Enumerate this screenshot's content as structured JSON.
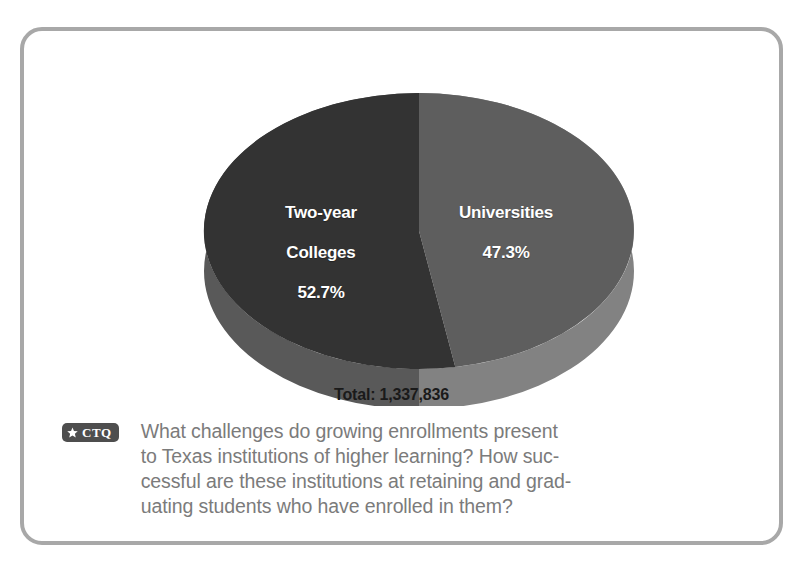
{
  "figure": {
    "frame_border_color": "#a8a8a8",
    "background_color": "#ffffff"
  },
  "chart_data": {
    "type": "pie",
    "title": "",
    "subtitle": "",
    "xlabel": "",
    "ylabel": "",
    "legend_position": "inside-slices",
    "grid": false,
    "total_label": "Total: 1,337,836",
    "total_value": 1337836,
    "categories": [
      "Two-year Colleges",
      "Universities"
    ],
    "values": [
      52.7,
      47.3
    ],
    "value_unit": "%",
    "slices": [
      {
        "name": "Two-year Colleges",
        "label_line1": "Two-year",
        "label_line2": "Colleges",
        "value": 52.7,
        "value_text": "52.7%",
        "color": "#333333",
        "side_color": "#595959"
      },
      {
        "name": "Universities",
        "label_line1": "Universities",
        "label_line2": "",
        "value": 47.3,
        "value_text": "47.3%",
        "color": "#5e5e5e",
        "side_color": "#828282"
      }
    ],
    "label_text_color": "#ffffff",
    "total_text_color": "#1a1a1a"
  },
  "ctq": {
    "badge_star_icon": "star-icon",
    "badge_label": "CTQ",
    "badge_background": "#4e4e4e",
    "text_color": "#7b7b7b",
    "lines": [
      "What challenges do growing enrollments present",
      "to Texas institutions of higher learning? How suc-",
      "cessful are these institutions at retaining and grad-",
      "uating students who have enrolled in them?"
    ],
    "full_text": "What challenges do growing enrollments present to Texas institutions of higher learning? How successful are these institutions at retaining and graduating students who have enrolled in them?"
  }
}
